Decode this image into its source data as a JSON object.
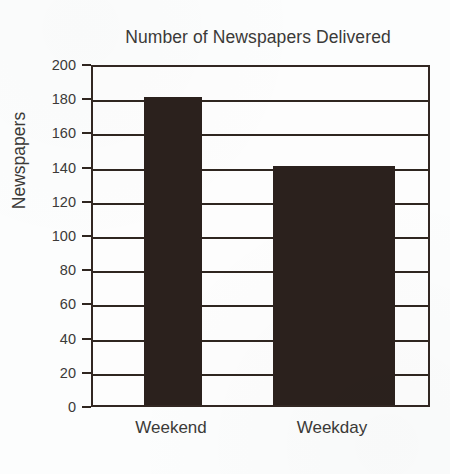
{
  "chart_data": {
    "type": "bar",
    "title": "Number of Newspapers Delivered",
    "xlabel": "",
    "ylabel": "Newspapers",
    "categories": [
      "Weekend",
      "Weekday"
    ],
    "values": [
      180,
      140
    ],
    "series": [
      {
        "name": "Newspapers",
        "values": [
          180,
          140
        ]
      }
    ],
    "ylim": [
      0,
      200
    ],
    "y_tick_step": 20,
    "y_tick_labels": [
      "0",
      "20",
      "40",
      "60",
      "80",
      "100",
      "120",
      "140",
      "160",
      "180",
      "200"
    ],
    "y_tick_values": [
      0,
      20,
      40,
      60,
      80,
      100,
      120,
      140,
      160,
      180,
      200
    ],
    "grid": "horizontal",
    "legend": "none",
    "bar_color": "#2b211d",
    "axis_color": "#2f2620",
    "plot_background": "#fdfdfd",
    "page_background": "#fcfdfd",
    "text_color": "#3b3a38",
    "bar_layout": [
      {
        "category": "Weekend",
        "value": 180,
        "left_px": 51,
        "width_px": 58,
        "center_px": 80
      },
      {
        "category": "Weekday",
        "value": 140,
        "left_px": 180,
        "width_px": 122,
        "center_px": 241
      }
    ]
  }
}
